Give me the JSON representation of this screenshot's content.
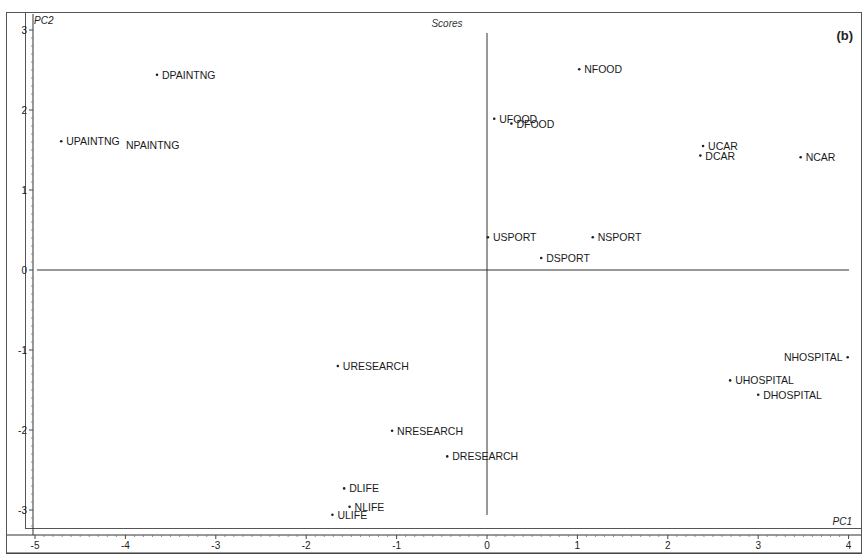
{
  "chart_data": {
    "type": "scatter",
    "title": "Scores",
    "panel_label": "(b)",
    "xlabel": "PC1",
    "ylabel": "PC2",
    "xlim": [
      -5.1,
      4.05
    ],
    "ylim": [
      -3.3,
      3.1
    ],
    "xticks": [
      -5,
      -4,
      -3,
      -2,
      -1,
      0,
      1,
      2,
      3,
      4
    ],
    "yticks": [
      3,
      2,
      1,
      0,
      -1,
      -2,
      -3
    ],
    "grid": false,
    "zero_lines": true,
    "points": [
      {
        "label": "DPAINTNG",
        "x": -3.65,
        "y": 2.44,
        "side": "right"
      },
      {
        "label": "UPAINTNG",
        "x": -4.71,
        "y": 1.61,
        "side": "right"
      },
      {
        "label": "NPAINTNG",
        "x": -4.05,
        "y": 1.56,
        "side": "right",
        "dot": false
      },
      {
        "label": "NFOOD",
        "x": 1.02,
        "y": 2.51,
        "side": "right"
      },
      {
        "label": "UFOOD",
        "x": 0.08,
        "y": 1.89,
        "side": "right"
      },
      {
        "label": "DFOOD",
        "x": 0.27,
        "y": 1.83,
        "side": "right"
      },
      {
        "label": "UCAR",
        "x": 2.39,
        "y": 1.55,
        "side": "right"
      },
      {
        "label": "DCAR",
        "x": 2.36,
        "y": 1.43,
        "side": "right"
      },
      {
        "label": "NCAR",
        "x": 3.47,
        "y": 1.41,
        "side": "right"
      },
      {
        "label": "USPORT",
        "x": 0.01,
        "y": 0.41,
        "side": "right"
      },
      {
        "label": "NSPORT",
        "x": 1.17,
        "y": 0.41,
        "side": "right"
      },
      {
        "label": "DSPORT",
        "x": 0.6,
        "y": 0.15,
        "side": "right"
      },
      {
        "label": "NHOSPITAL",
        "x": 3.99,
        "y": -1.09,
        "side": "left"
      },
      {
        "label": "UHOSPITAL",
        "x": 2.69,
        "y": -1.38,
        "side": "right"
      },
      {
        "label": "DHOSPITAL",
        "x": 3.0,
        "y": -1.56,
        "side": "right"
      },
      {
        "label": "URESEARCH",
        "x": -1.65,
        "y": -1.2,
        "side": "right"
      },
      {
        "label": "NRESEARCH",
        "x": -1.05,
        "y": -2.01,
        "side": "right"
      },
      {
        "label": "DRESEARCH",
        "x": -0.44,
        "y": -2.33,
        "side": "right"
      },
      {
        "label": "DLIFE",
        "x": -1.58,
        "y": -2.73,
        "side": "right"
      },
      {
        "label": "NLIFE",
        "x": -1.52,
        "y": -2.96,
        "side": "right"
      },
      {
        "label": "ULIFE",
        "x": -1.71,
        "y": -3.06,
        "side": "right"
      }
    ]
  }
}
